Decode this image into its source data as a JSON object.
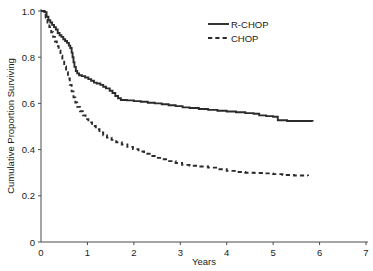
{
  "chart_data": {
    "type": "line",
    "title": "",
    "subtitle": "",
    "xlabel": "Years",
    "ylabel": "Cumulative Proportion Surviving",
    "xlim": [
      0,
      7
    ],
    "ylim": [
      0,
      1.0
    ],
    "grid": false,
    "legend_position": "top-right",
    "x_ticks": [
      0,
      1,
      2,
      3,
      4,
      5,
      6,
      7
    ],
    "x_tick_labels": [
      "0",
      "1",
      "2",
      "3",
      "4",
      "5",
      "6",
      "7"
    ],
    "y_ticks": [
      0,
      0.2,
      0.4,
      0.6,
      0.8,
      1.0
    ],
    "y_tick_labels": [
      "0",
      "0.2",
      "0.4",
      "0.6",
      "0.8",
      "1.0"
    ],
    "series": [
      {
        "name": "R-CHOP",
        "style": "solid",
        "color": "#2b2b2b",
        "points": [
          [
            0.0,
            1.0
          ],
          [
            0.08,
            0.995
          ],
          [
            0.12,
            0.975
          ],
          [
            0.16,
            0.96
          ],
          [
            0.2,
            0.95
          ],
          [
            0.24,
            0.94
          ],
          [
            0.28,
            0.93
          ],
          [
            0.32,
            0.92
          ],
          [
            0.36,
            0.905
          ],
          [
            0.4,
            0.895
          ],
          [
            0.44,
            0.888
          ],
          [
            0.48,
            0.878
          ],
          [
            0.52,
            0.87
          ],
          [
            0.56,
            0.862
          ],
          [
            0.6,
            0.85
          ],
          [
            0.63,
            0.84
          ],
          [
            0.66,
            0.82
          ],
          [
            0.68,
            0.8
          ],
          [
            0.7,
            0.778
          ],
          [
            0.72,
            0.758
          ],
          [
            0.75,
            0.74
          ],
          [
            0.78,
            0.73
          ],
          [
            0.82,
            0.722
          ],
          [
            0.88,
            0.718
          ],
          [
            0.95,
            0.712
          ],
          [
            1.02,
            0.705
          ],
          [
            1.08,
            0.698
          ],
          [
            1.14,
            0.69
          ],
          [
            1.2,
            0.686
          ],
          [
            1.28,
            0.68
          ],
          [
            1.34,
            0.672
          ],
          [
            1.4,
            0.665
          ],
          [
            1.48,
            0.655
          ],
          [
            1.54,
            0.645
          ],
          [
            1.6,
            0.632
          ],
          [
            1.66,
            0.622
          ],
          [
            1.72,
            0.615
          ],
          [
            1.85,
            0.613
          ],
          [
            2.0,
            0.61
          ],
          [
            2.15,
            0.607
          ],
          [
            2.3,
            0.603
          ],
          [
            2.45,
            0.6
          ],
          [
            2.6,
            0.596
          ],
          [
            2.75,
            0.592
          ],
          [
            2.9,
            0.588
          ],
          [
            3.05,
            0.583
          ],
          [
            3.2,
            0.58
          ],
          [
            3.4,
            0.576
          ],
          [
            3.6,
            0.572
          ],
          [
            3.8,
            0.568
          ],
          [
            4.0,
            0.565
          ],
          [
            4.2,
            0.562
          ],
          [
            4.4,
            0.558
          ],
          [
            4.58,
            0.555
          ],
          [
            4.7,
            0.548
          ],
          [
            4.85,
            0.545
          ],
          [
            5.0,
            0.542
          ],
          [
            5.1,
            0.527
          ],
          [
            5.3,
            0.524
          ],
          [
            5.85,
            0.522
          ]
        ]
      },
      {
        "name": "CHOP",
        "style": "dashed",
        "color": "#2b2b2b",
        "points": [
          [
            0.0,
            1.0
          ],
          [
            0.06,
            0.99
          ],
          [
            0.1,
            0.972
          ],
          [
            0.14,
            0.95
          ],
          [
            0.18,
            0.93
          ],
          [
            0.22,
            0.908
          ],
          [
            0.26,
            0.888
          ],
          [
            0.3,
            0.868
          ],
          [
            0.34,
            0.848
          ],
          [
            0.38,
            0.828
          ],
          [
            0.42,
            0.806
          ],
          [
            0.46,
            0.785
          ],
          [
            0.5,
            0.76
          ],
          [
            0.54,
            0.735
          ],
          [
            0.58,
            0.708
          ],
          [
            0.62,
            0.68
          ],
          [
            0.66,
            0.652
          ],
          [
            0.7,
            0.626
          ],
          [
            0.74,
            0.604
          ],
          [
            0.78,
            0.585
          ],
          [
            0.84,
            0.566
          ],
          [
            0.9,
            0.548
          ],
          [
            0.96,
            0.532
          ],
          [
            1.02,
            0.518
          ],
          [
            1.1,
            0.502
          ],
          [
            1.18,
            0.488
          ],
          [
            1.26,
            0.474
          ],
          [
            1.34,
            0.462
          ],
          [
            1.42,
            0.452
          ],
          [
            1.52,
            0.442
          ],
          [
            1.62,
            0.432
          ],
          [
            1.74,
            0.422
          ],
          [
            1.86,
            0.412
          ],
          [
            1.98,
            0.402
          ],
          [
            2.1,
            0.392
          ],
          [
            2.22,
            0.382
          ],
          [
            2.34,
            0.372
          ],
          [
            2.48,
            0.364
          ],
          [
            2.62,
            0.358
          ],
          [
            2.76,
            0.35
          ],
          [
            2.9,
            0.342
          ],
          [
            3.04,
            0.334
          ],
          [
            3.2,
            0.33
          ],
          [
            3.4,
            0.327
          ],
          [
            3.6,
            0.322
          ],
          [
            3.8,
            0.315
          ],
          [
            4.0,
            0.308
          ],
          [
            4.2,
            0.303
          ],
          [
            4.4,
            0.3
          ],
          [
            4.6,
            0.299
          ],
          [
            4.8,
            0.297
          ],
          [
            5.0,
            0.294
          ],
          [
            5.2,
            0.29
          ],
          [
            5.45,
            0.288
          ],
          [
            5.75,
            0.286
          ]
        ]
      }
    ]
  },
  "axes": {
    "ylabel": "Cumulative Proportion Surviving",
    "xlabel": "Years"
  },
  "legend": {
    "items": [
      {
        "label": "R-CHOP",
        "style": "solid"
      },
      {
        "label": "CHOP",
        "style": "dashed"
      }
    ]
  }
}
